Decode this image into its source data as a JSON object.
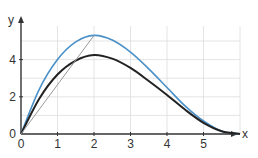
{
  "chart_data": {
    "type": "line",
    "title": "",
    "xlabel": "x",
    "ylabel": "y",
    "xlim": [
      0,
      6
    ],
    "ylim": [
      0,
      5.8
    ],
    "x_ticks": [
      "0",
      "1",
      "2",
      "3",
      "4",
      "5"
    ],
    "y_ticks": [
      "0",
      "2",
      "4"
    ],
    "grid": true,
    "series": [
      {
        "name": "blue curve",
        "color": "#4a90c8",
        "x": [
          0,
          0.5,
          1,
          1.5,
          2,
          2.5,
          3,
          3.5,
          4,
          4.5,
          5,
          5.5,
          6
        ],
        "y": [
          0,
          2.4,
          4.0,
          4.95,
          5.3,
          5.05,
          4.4,
          3.5,
          2.5,
          1.5,
          0.7,
          0.15,
          0
        ]
      },
      {
        "name": "black curve",
        "color": "#222222",
        "x": [
          0,
          0.5,
          1,
          1.5,
          2,
          2.5,
          3,
          3.5,
          4,
          4.5,
          5,
          5.5,
          6
        ],
        "y": [
          0,
          1.9,
          3.2,
          3.95,
          4.25,
          4.05,
          3.55,
          2.85,
          2.1,
          1.3,
          0.6,
          0.15,
          0
        ]
      },
      {
        "name": "gray secant line",
        "color": "#999999",
        "x": [
          0,
          2
        ],
        "y": [
          0,
          5.3
        ]
      }
    ]
  }
}
